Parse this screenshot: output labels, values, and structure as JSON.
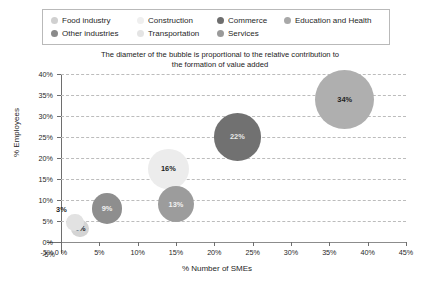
{
  "legend": {
    "rows": [
      [
        {
          "label": "Food industry",
          "color": "#d0d0d0"
        },
        {
          "label": "Construction",
          "color": "#efefef"
        },
        {
          "label": "Commerce",
          "color": "#6e6e6e"
        },
        {
          "label": "Education and Health",
          "color": "#a8a8a8"
        }
      ],
      [
        {
          "label": "Other industries",
          "color": "#8a8a8a"
        },
        {
          "label": "Transportation",
          "color": "#e4e4e4"
        },
        {
          "label": "Services",
          "color": "#9a9a9a"
        }
      ]
    ]
  },
  "title": {
    "line1": "The diameter of the bubble is proportional to the relative contribution to",
    "line2": "the formation of value added"
  },
  "chart_data": {
    "type": "scatter",
    "title": "The diameter of the bubble is proportional to the relative contribution to the formation of value added",
    "xlabel": "% Number of SMEs",
    "ylabel": "% Employees",
    "xlim": [
      -5,
      45
    ],
    "ylim": [
      -5,
      40
    ],
    "grid": true,
    "legend_position": "top",
    "x_ticks": [
      "-5%",
      "0 %",
      "5%",
      "10%",
      "15%",
      "20%",
      "25%",
      "30%",
      "35%",
      "40%",
      "45%"
    ],
    "x_tick_values": [
      -5,
      0,
      5,
      10,
      15,
      20,
      25,
      30,
      35,
      40,
      45
    ],
    "y_ticks": [
      "-5%",
      "0%",
      "5%",
      "10%",
      "15%",
      "20%",
      "25%",
      "30%",
      "35%",
      "40%"
    ],
    "y_tick_values": [
      -5,
      0,
      5,
      10,
      15,
      20,
      25,
      30,
      35,
      40
    ],
    "size_note": "Bubble diameter is proportional to the relative contribution to value added",
    "points": [
      {
        "name": "Food industry",
        "x": 2.5,
        "y": 3.2,
        "size_label": "3%",
        "size_value": 3,
        "color": "#d4d4d4",
        "label_color": "#1f1f1f",
        "label_inside": true
      },
      {
        "name": "Transportation",
        "x": 1.8,
        "y": 4.6,
        "size_label": "3%",
        "size_value": 3,
        "color": "#e2e2e2",
        "label_color": "#1f1f1f",
        "label_inside": false
      },
      {
        "name": "Other industries",
        "x": 6.0,
        "y": 8.0,
        "size_label": "9%",
        "size_value": 9,
        "color": "#8e8e8e",
        "label_color": "#f2f2f2",
        "label_inside": true
      },
      {
        "name": "Construction",
        "x": 14.0,
        "y": 17.4,
        "size_label": "16%",
        "size_value": 16,
        "color": "#ececec",
        "label_color": "#1f1f1f",
        "label_inside": true
      },
      {
        "name": "Services",
        "x": 15.0,
        "y": 9.0,
        "size_label": "13%",
        "size_value": 13,
        "color": "#9c9c9c",
        "label_color": "#f2f2f2",
        "label_inside": true
      },
      {
        "name": "Commerce",
        "x": 23.0,
        "y": 25.0,
        "size_label": "22%",
        "size_value": 22,
        "color": "#717171",
        "label_color": "#e8e8e8",
        "label_inside": true
      },
      {
        "name": "Education and Health",
        "x": 37.0,
        "y": 34.0,
        "size_label": "34%",
        "size_value": 34,
        "color": "#afafaf",
        "label_color": "#1f1f1f",
        "label_inside": true
      }
    ]
  }
}
